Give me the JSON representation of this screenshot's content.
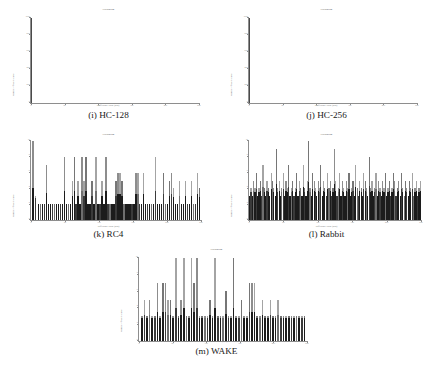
{
  "figure": {
    "panels": [
      {
        "id": "hc128",
        "caption": "(i) HC-128",
        "title": "Histogram",
        "xlabel": "Difference value (bits)",
        "ylabel": "Number of occurrences",
        "xticks": [
          "0",
          "50",
          "100",
          "150",
          "200",
          "250"
        ],
        "yticks": [
          "0",
          "200",
          "400",
          "600",
          "800",
          "1000"
        ]
      },
      {
        "id": "hc256",
        "caption": "(j) HC-256",
        "title": "Histogram",
        "xlabel": "Difference value (bits)",
        "ylabel": "Number of occurrences",
        "xticks": [
          "0",
          "50",
          "100",
          "150",
          "200",
          "250"
        ],
        "yticks": [
          "0",
          "200",
          "400",
          "600",
          "800",
          "1000"
        ]
      },
      {
        "id": "rc4",
        "caption": "(k) RC4",
        "title": "Histogram",
        "xlabel": "Difference value (bits)",
        "ylabel": "Number of occurrences",
        "xticks": [
          "0",
          "50",
          "100",
          "150",
          "200",
          "250"
        ],
        "yticks": [
          "0",
          "2",
          "4",
          "6",
          "8",
          "10"
        ]
      },
      {
        "id": "rabbit",
        "caption": "(l) Rabbit",
        "title": "Histogram",
        "xlabel": "Difference value (bits)",
        "ylabel": "Number of occurrences",
        "xticks": [
          "0",
          "50",
          "100",
          "150",
          "200",
          "250"
        ],
        "yticks": [
          "0",
          "2",
          "4",
          "6",
          "8",
          "10"
        ]
      },
      {
        "id": "wake",
        "caption": "(m) WAKE",
        "title": "Histogram",
        "xlabel": "Difference value (bits)",
        "ylabel": "Number of occurrences",
        "xticks": [
          "0",
          "50",
          "100",
          "150",
          "200",
          "250"
        ],
        "yticks": [
          "0",
          "2",
          "4",
          "6",
          "8",
          "10"
        ]
      }
    ]
  },
  "chart_data": [
    {
      "type": "bar",
      "id": "hc128",
      "title": "(i) HC-128",
      "xlabel": "Difference value (bits)",
      "ylabel": "Number of occurrences",
      "xlim": [
        0,
        256
      ],
      "ylim": [
        0,
        1000
      ],
      "grid": false,
      "legend": null,
      "note": "Single degenerate spike at difference value 0 reaching the full vertical extent; all other bins are zero.",
      "x": [
        0
      ],
      "values": [
        1000
      ]
    },
    {
      "type": "bar",
      "id": "hc256",
      "title": "(j) HC-256",
      "xlabel": "Difference value (bits)",
      "ylabel": "Number of occurrences",
      "xlim": [
        0,
        256
      ],
      "ylim": [
        0,
        1000
      ],
      "grid": false,
      "legend": null,
      "note": "Single degenerate spike at difference value 0 reaching the full vertical extent; all other bins are zero.",
      "x": [
        0
      ],
      "values": [
        1000
      ]
    },
    {
      "type": "bar",
      "id": "rc4",
      "title": "(k) RC4",
      "xlabel": "Difference value (bits)",
      "ylabel": "Number of occurrences",
      "xlim": [
        0,
        256
      ],
      "ylim": [
        0,
        10
      ],
      "grid": false,
      "legend": null,
      "note": "Sparse histogram; bars drawn as dark base with lighter upper segment.",
      "x": [
        2,
        6,
        10,
        13,
        16,
        19,
        22,
        25,
        28,
        31,
        34,
        37,
        40,
        43,
        46,
        49,
        52,
        55,
        58,
        61,
        64,
        67,
        70,
        73,
        76,
        79,
        82,
        85,
        88,
        91,
        94,
        97,
        100,
        103,
        106,
        109,
        112,
        115,
        118,
        121,
        124,
        127,
        130,
        133,
        136,
        139,
        142,
        145,
        148,
        151,
        154,
        157,
        160,
        163,
        166,
        169,
        172,
        175,
        178,
        181,
        184,
        187,
        190,
        193,
        196,
        199,
        202,
        205,
        208,
        211,
        214,
        217,
        220,
        223,
        226,
        229,
        232,
        235,
        238,
        241,
        244,
        247,
        250,
        253
      ],
      "values": [
        10,
        3,
        2,
        2,
        2,
        2,
        7,
        2,
        2,
        2,
        2,
        2,
        2,
        2,
        2,
        8,
        2,
        2,
        2,
        5,
        8,
        2,
        5,
        2,
        8,
        5,
        8,
        2,
        2,
        5,
        2,
        8,
        2,
        2,
        5,
        2,
        8,
        2,
        2,
        2,
        2,
        5,
        6,
        6,
        5,
        2,
        2,
        2,
        2,
        2,
        2,
        6,
        6,
        2,
        2,
        6,
        2,
        2,
        2,
        2,
        2,
        8,
        2,
        2,
        2,
        6,
        2,
        2,
        5,
        6,
        4,
        2,
        2,
        5,
        2,
        2,
        5,
        2,
        2,
        5,
        2,
        2,
        6,
        4
      ]
    },
    {
      "type": "bar",
      "id": "rabbit",
      "title": "(l) Rabbit",
      "xlabel": "Difference value (bits)",
      "ylabel": "Number of occurrences",
      "xlim": [
        0,
        256
      ],
      "ylim": [
        0,
        10
      ],
      "grid": false,
      "legend": null,
      "note": "Dense histogram with nearly every bin populated; dark solid base across the full width with scattered taller light-grey peaks.",
      "x": [
        0,
        2,
        4,
        6,
        8,
        10,
        12,
        14,
        16,
        18,
        20,
        22,
        24,
        26,
        28,
        30,
        32,
        34,
        36,
        38,
        40,
        42,
        44,
        46,
        48,
        50,
        52,
        54,
        56,
        58,
        60,
        62,
        64,
        66,
        68,
        70,
        72,
        74,
        76,
        78,
        80,
        82,
        84,
        86,
        88,
        90,
        92,
        94,
        96,
        98,
        100,
        102,
        104,
        106,
        108,
        110,
        112,
        114,
        116,
        118,
        120,
        122,
        124,
        126,
        128,
        130,
        132,
        134,
        136,
        138,
        140,
        142,
        144,
        146,
        148,
        150,
        152,
        154,
        156,
        158,
        160,
        162,
        164,
        166,
        168,
        170,
        172,
        174,
        176,
        178,
        180,
        182,
        184,
        186,
        188,
        190,
        192,
        194,
        196,
        198,
        200,
        202,
        204,
        206,
        208,
        210,
        212,
        214,
        216,
        218,
        220,
        222,
        224,
        226,
        228,
        230,
        232,
        234,
        236,
        238,
        240,
        242,
        244,
        246,
        248,
        250,
        252,
        254
      ],
      "values": [
        3,
        4,
        3,
        5,
        4,
        6,
        3,
        4,
        5,
        3,
        7,
        4,
        3,
        5,
        4,
        3,
        6,
        5,
        4,
        3,
        9,
        4,
        5,
        3,
        4,
        6,
        3,
        5,
        4,
        7,
        3,
        4,
        5,
        3,
        4,
        6,
        3,
        5,
        4,
        3,
        7,
        4,
        3,
        5,
        10,
        4,
        3,
        6,
        5,
        4,
        3,
        5,
        4,
        7,
        3,
        5,
        4,
        3,
        6,
        4,
        5,
        3,
        4,
        9,
        5,
        3,
        4,
        6,
        3,
        5,
        4,
        3,
        5,
        4,
        6,
        3,
        4,
        5,
        3,
        7,
        4,
        3,
        5,
        4,
        3,
        6,
        5,
        4,
        3,
        8,
        4,
        5,
        3,
        4,
        6,
        3,
        5,
        4,
        3,
        5,
        4,
        6,
        3,
        4,
        5,
        3,
        4,
        6,
        5,
        3,
        4,
        5,
        3,
        6,
        4,
        3,
        5,
        4,
        3,
        5,
        4,
        6,
        3,
        4,
        5,
        3,
        4,
        5
      ]
    },
    {
      "type": "bar",
      "id": "wake",
      "title": "(m) WAKE",
      "xlabel": "Difference value (bits)",
      "ylabel": "Number of occurrences",
      "xlim": [
        0,
        256
      ],
      "ylim": [
        0,
        10
      ],
      "grid": false,
      "legend": null,
      "note": "Sparse-to-moderate histogram; dark bases with light grey tops and several full-height spikes.",
      "x": [
        3,
        7,
        11,
        15,
        19,
        23,
        27,
        31,
        35,
        39,
        43,
        47,
        51,
        55,
        59,
        63,
        67,
        71,
        75,
        79,
        83,
        87,
        91,
        95,
        99,
        103,
        107,
        111,
        115,
        119,
        123,
        127,
        131,
        135,
        139,
        143,
        147,
        151,
        155,
        159,
        163,
        167,
        171,
        175,
        179,
        183,
        187,
        191,
        195,
        199,
        203,
        207,
        211,
        215,
        219,
        223,
        227,
        231,
        235,
        239,
        243,
        247,
        251
      ],
      "values": [
        3,
        5,
        3,
        5,
        3,
        3,
        7,
        3,
        7,
        7,
        5,
        5,
        3,
        10,
        3,
        5,
        10,
        3,
        3,
        10,
        7,
        10,
        3,
        3,
        3,
        3,
        5,
        3,
        10,
        3,
        3,
        3,
        6,
        3,
        3,
        10,
        3,
        3,
        5,
        3,
        3,
        7,
        7,
        7,
        3,
        3,
        5,
        3,
        3,
        5,
        3,
        3,
        5,
        3,
        3,
        3,
        3,
        3,
        3,
        3,
        3,
        3,
        3
      ]
    }
  ]
}
